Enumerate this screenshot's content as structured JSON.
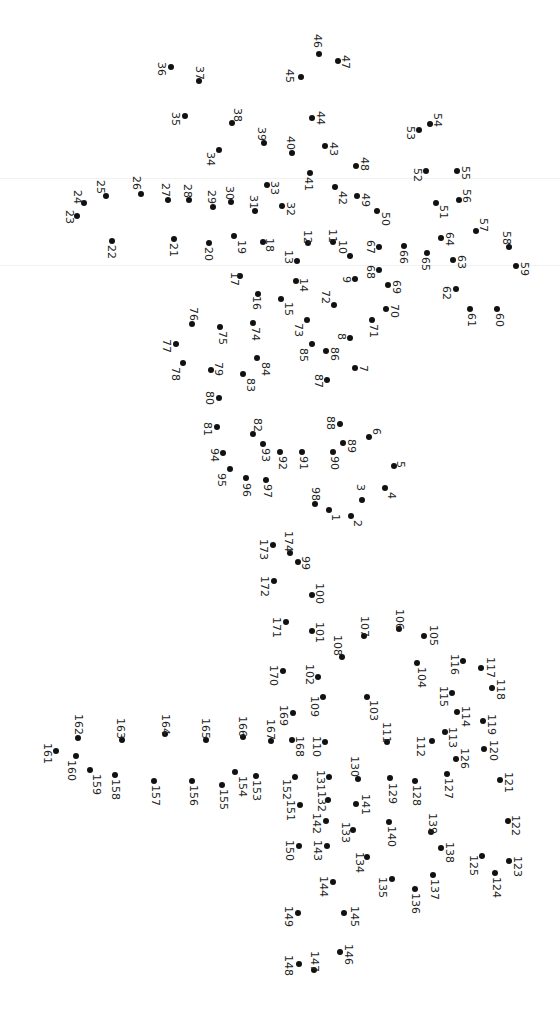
{
  "puzzle": {
    "type": "connect-the-dots",
    "orientation": "rotated 90 degrees clockwise",
    "dot_color": "#111111",
    "background": "#ffffff",
    "dots": [
      {
        "n": 1,
        "x": 329,
        "y": 510,
        "lx": 332,
        "ly": 514
      },
      {
        "n": 2,
        "x": 351,
        "y": 516,
        "lx": 354,
        "ly": 520
      },
      {
        "n": 3,
        "x": 362,
        "y": 500,
        "lx": 357,
        "ly": 484
      },
      {
        "n": 4,
        "x": 385,
        "y": 488,
        "lx": 388,
        "ly": 492
      },
      {
        "n": 5,
        "x": 394,
        "y": 466,
        "lx": 397,
        "ly": 461
      },
      {
        "n": 6,
        "x": 369,
        "y": 437,
        "lx": 373,
        "ly": 428
      },
      {
        "n": 7,
        "x": 355,
        "y": 368,
        "lx": 360,
        "ly": 365
      },
      {
        "n": 8,
        "x": 350,
        "y": 338,
        "lx": 338,
        "ly": 333
      },
      {
        "n": 9,
        "x": 355,
        "y": 279,
        "lx": 343,
        "ly": 276
      },
      {
        "n": 10,
        "x": 350,
        "y": 256,
        "lx": 339,
        "ly": 240
      },
      {
        "n": 11,
        "x": 333,
        "y": 242,
        "lx": 329,
        "ly": 229
      },
      {
        "n": 12,
        "x": 308,
        "y": 243,
        "lx": 304,
        "ly": 230
      },
      {
        "n": 13,
        "x": 297,
        "y": 261,
        "lx": 285,
        "ly": 250
      },
      {
        "n": 14,
        "x": 296,
        "y": 281,
        "lx": 300,
        "ly": 278
      },
      {
        "n": 15,
        "x": 281,
        "y": 299,
        "lx": 285,
        "ly": 302
      },
      {
        "n": 16,
        "x": 258,
        "y": 294,
        "lx": 253,
        "ly": 296
      },
      {
        "n": 17,
        "x": 240,
        "y": 276,
        "lx": 231,
        "ly": 272
      },
      {
        "n": 18,
        "x": 263,
        "y": 242,
        "lx": 266,
        "ly": 238
      },
      {
        "n": 19,
        "x": 234,
        "y": 236,
        "lx": 238,
        "ly": 240
      },
      {
        "n": 20,
        "x": 209,
        "y": 243,
        "lx": 205,
        "ly": 247
      },
      {
        "n": 21,
        "x": 174,
        "y": 239,
        "lx": 170,
        "ly": 243
      },
      {
        "n": 22,
        "x": 112,
        "y": 241,
        "lx": 108,
        "ly": 245
      },
      {
        "n": 23,
        "x": 77,
        "y": 216,
        "lx": 66,
        "ly": 210
      },
      {
        "n": 24,
        "x": 84,
        "y": 203,
        "lx": 74,
        "ly": 190
      },
      {
        "n": 25,
        "x": 106,
        "y": 196,
        "lx": 97,
        "ly": 180
      },
      {
        "n": 26,
        "x": 141,
        "y": 194,
        "lx": 133,
        "ly": 176
      },
      {
        "n": 27,
        "x": 168,
        "y": 200,
        "lx": 162,
        "ly": 183
      },
      {
        "n": 28,
        "x": 189,
        "y": 200,
        "lx": 184,
        "ly": 184
      },
      {
        "n": 29,
        "x": 213,
        "y": 207,
        "lx": 208,
        "ly": 190
      },
      {
        "n": 30,
        "x": 231,
        "y": 202,
        "lx": 226,
        "ly": 186
      },
      {
        "n": 31,
        "x": 255,
        "y": 211,
        "lx": 250,
        "ly": 195
      },
      {
        "n": 32,
        "x": 282,
        "y": 206,
        "lx": 287,
        "ly": 202
      },
      {
        "n": 33,
        "x": 267,
        "y": 185,
        "lx": 271,
        "ly": 181
      },
      {
        "n": 34,
        "x": 219,
        "y": 150,
        "lx": 207,
        "ly": 152
      },
      {
        "n": 35,
        "x": 185,
        "y": 116,
        "lx": 172,
        "ly": 112
      },
      {
        "n": 36,
        "x": 171,
        "y": 67,
        "lx": 158,
        "ly": 62
      },
      {
        "n": 37,
        "x": 199,
        "y": 81,
        "lx": 196,
        "ly": 66
      },
      {
        "n": 38,
        "x": 232,
        "y": 123,
        "lx": 234,
        "ly": 108
      },
      {
        "n": 39,
        "x": 264,
        "y": 143,
        "lx": 258,
        "ly": 127
      },
      {
        "n": 40,
        "x": 292,
        "y": 153,
        "lx": 287,
        "ly": 136
      },
      {
        "n": 41,
        "x": 310,
        "y": 173,
        "lx": 305,
        "ly": 177
      },
      {
        "n": 42,
        "x": 335,
        "y": 187,
        "lx": 339,
        "ly": 191
      },
      {
        "n": 43,
        "x": 325,
        "y": 146,
        "lx": 330,
        "ly": 142
      },
      {
        "n": 44,
        "x": 312,
        "y": 118,
        "lx": 317,
        "ly": 111
      },
      {
        "n": 45,
        "x": 301,
        "y": 77,
        "lx": 286,
        "ly": 69
      },
      {
        "n": 46,
        "x": 319,
        "y": 54,
        "lx": 314,
        "ly": 34
      },
      {
        "n": 47,
        "x": 338,
        "y": 61,
        "lx": 342,
        "ly": 55
      },
      {
        "n": 48,
        "x": 356,
        "y": 166,
        "lx": 361,
        "ly": 157
      },
      {
        "n": 49,
        "x": 357,
        "y": 196,
        "lx": 362,
        "ly": 193
      },
      {
        "n": 50,
        "x": 377,
        "y": 211,
        "lx": 382,
        "ly": 212
      },
      {
        "n": 51,
        "x": 436,
        "y": 203,
        "lx": 440,
        "ly": 205
      },
      {
        "n": 52,
        "x": 426,
        "y": 171,
        "lx": 414,
        "ly": 168
      },
      {
        "n": 53,
        "x": 419,
        "y": 130,
        "lx": 407,
        "ly": 126
      },
      {
        "n": 54,
        "x": 430,
        "y": 124,
        "lx": 434,
        "ly": 113
      },
      {
        "n": 55,
        "x": 457,
        "y": 171,
        "lx": 462,
        "ly": 166
      },
      {
        "n": 56,
        "x": 459,
        "y": 200,
        "lx": 463,
        "ly": 189
      },
      {
        "n": 57,
        "x": 476,
        "y": 231,
        "lx": 480,
        "ly": 218
      },
      {
        "n": 58,
        "x": 509,
        "y": 247,
        "lx": 503,
        "ly": 231
      },
      {
        "n": 59,
        "x": 516,
        "y": 266,
        "lx": 521,
        "ly": 262
      },
      {
        "n": 60,
        "x": 497,
        "y": 309,
        "lx": 496,
        "ly": 313
      },
      {
        "n": 61,
        "x": 470,
        "y": 309,
        "lx": 468,
        "ly": 313
      },
      {
        "n": 62,
        "x": 456,
        "y": 289,
        "lx": 443,
        "ly": 286
      },
      {
        "n": 63,
        "x": 453,
        "y": 260,
        "lx": 458,
        "ly": 255
      },
      {
        "n": 64,
        "x": 441,
        "y": 238,
        "lx": 446,
        "ly": 232
      },
      {
        "n": 65,
        "x": 427,
        "y": 253,
        "lx": 422,
        "ly": 257
      },
      {
        "n": 66,
        "x": 404,
        "y": 246,
        "lx": 400,
        "ly": 250
      },
      {
        "n": 67,
        "x": 379,
        "y": 247,
        "lx": 367,
        "ly": 240
      },
      {
        "n": 68,
        "x": 379,
        "y": 270,
        "lx": 367,
        "ly": 265
      },
      {
        "n": 69,
        "x": 388,
        "y": 285,
        "lx": 393,
        "ly": 280
      },
      {
        "n": 70,
        "x": 386,
        "y": 309,
        "lx": 391,
        "ly": 304
      },
      {
        "n": 71,
        "x": 372,
        "y": 320,
        "lx": 370,
        "ly": 324
      },
      {
        "n": 72,
        "x": 334,
        "y": 305,
        "lx": 322,
        "ly": 290
      },
      {
        "n": 73,
        "x": 307,
        "y": 320,
        "lx": 295,
        "ly": 323
      },
      {
        "n": 74,
        "x": 253,
        "y": 323,
        "lx": 252,
        "ly": 327
      },
      {
        "n": 75,
        "x": 220,
        "y": 327,
        "lx": 219,
        "ly": 331
      },
      {
        "n": 76,
        "x": 192,
        "y": 324,
        "lx": 190,
        "ly": 307
      },
      {
        "n": 77,
        "x": 176,
        "y": 344,
        "lx": 163,
        "ly": 339
      },
      {
        "n": 78,
        "x": 183,
        "y": 363,
        "lx": 172,
        "ly": 367
      },
      {
        "n": 79,
        "x": 211,
        "y": 370,
        "lx": 215,
        "ly": 362
      },
      {
        "n": 80,
        "x": 219,
        "y": 398,
        "lx": 206,
        "ly": 391
      },
      {
        "n": 81,
        "x": 217,
        "y": 427,
        "lx": 204,
        "ly": 422
      },
      {
        "n": 82,
        "x": 253,
        "y": 434,
        "lx": 254,
        "ly": 418
      },
      {
        "n": 83,
        "x": 243,
        "y": 374,
        "lx": 247,
        "ly": 378
      },
      {
        "n": 84,
        "x": 257,
        "y": 358,
        "lx": 262,
        "ly": 362
      },
      {
        "n": 85,
        "x": 312,
        "y": 344,
        "lx": 300,
        "ly": 348
      },
      {
        "n": 86,
        "x": 326,
        "y": 351,
        "lx": 331,
        "ly": 347
      },
      {
        "n": 87,
        "x": 327,
        "y": 380,
        "lx": 315,
        "ly": 374
      },
      {
        "n": 88,
        "x": 340,
        "y": 424,
        "lx": 327,
        "ly": 416
      },
      {
        "n": 89,
        "x": 343,
        "y": 443,
        "lx": 348,
        "ly": 439
      },
      {
        "n": 90,
        "x": 333,
        "y": 452,
        "lx": 331,
        "ly": 456
      },
      {
        "n": 91,
        "x": 302,
        "y": 452,
        "lx": 300,
        "ly": 456
      },
      {
        "n": 92,
        "x": 280,
        "y": 452,
        "lx": 279,
        "ly": 456
      },
      {
        "n": 93,
        "x": 263,
        "y": 444,
        "lx": 262,
        "ly": 448
      },
      {
        "n": 94,
        "x": 223,
        "y": 453,
        "lx": 211,
        "ly": 448
      },
      {
        "n": 95,
        "x": 230,
        "y": 469,
        "lx": 218,
        "ly": 473
      },
      {
        "n": 96,
        "x": 246,
        "y": 478,
        "lx": 243,
        "ly": 483
      },
      {
        "n": 97,
        "x": 266,
        "y": 480,
        "lx": 264,
        "ly": 484
      },
      {
        "n": 98,
        "x": 315,
        "y": 504,
        "lx": 312,
        "ly": 487
      },
      {
        "n": 99,
        "x": 298,
        "y": 562,
        "lx": 302,
        "ly": 556
      },
      {
        "n": 100,
        "x": 312,
        "y": 595,
        "lx": 316,
        "ly": 583
      },
      {
        "n": 101,
        "x": 312,
        "y": 631,
        "lx": 316,
        "ly": 622
      },
      {
        "n": 102,
        "x": 318,
        "y": 677,
        "lx": 306,
        "ly": 664
      },
      {
        "n": 103,
        "x": 367,
        "y": 697,
        "lx": 370,
        "ly": 700
      },
      {
        "n": 104,
        "x": 417,
        "y": 663,
        "lx": 418,
        "ly": 667
      },
      {
        "n": 105,
        "x": 424,
        "y": 636,
        "lx": 430,
        "ly": 625
      },
      {
        "n": 106,
        "x": 399,
        "y": 629,
        "lx": 396,
        "ly": 609
      },
      {
        "n": 107,
        "x": 364,
        "y": 636,
        "lx": 361,
        "ly": 616
      },
      {
        "n": 108,
        "x": 342,
        "y": 657,
        "lx": 334,
        "ly": 635
      },
      {
        "n": 109,
        "x": 323,
        "y": 697,
        "lx": 311,
        "ly": 696
      },
      {
        "n": 110,
        "x": 325,
        "y": 742,
        "lx": 313,
        "ly": 736
      },
      {
        "n": 111,
        "x": 387,
        "y": 742,
        "lx": 383,
        "ly": 722
      },
      {
        "n": 112,
        "x": 432,
        "y": 741,
        "lx": 417,
        "ly": 736
      },
      {
        "n": 113,
        "x": 445,
        "y": 732,
        "lx": 449,
        "ly": 727
      },
      {
        "n": 114,
        "x": 457,
        "y": 712,
        "lx": 462,
        "ly": 706
      },
      {
        "n": 115,
        "x": 452,
        "y": 693,
        "lx": 440,
        "ly": 686
      },
      {
        "n": 116,
        "x": 463,
        "y": 661,
        "lx": 451,
        "ly": 654
      },
      {
        "n": 117,
        "x": 481,
        "y": 668,
        "lx": 487,
        "ly": 657
      },
      {
        "n": 118,
        "x": 492,
        "y": 688,
        "lx": 497,
        "ly": 679
      },
      {
        "n": 119,
        "x": 483,
        "y": 721,
        "lx": 488,
        "ly": 714
      },
      {
        "n": 120,
        "x": 484,
        "y": 749,
        "lx": 490,
        "ly": 740
      },
      {
        "n": 121,
        "x": 500,
        "y": 780,
        "lx": 505,
        "ly": 772
      },
      {
        "n": 122,
        "x": 508,
        "y": 821,
        "lx": 512,
        "ly": 815
      },
      {
        "n": 123,
        "x": 509,
        "y": 861,
        "lx": 514,
        "ly": 856
      },
      {
        "n": 124,
        "x": 495,
        "y": 873,
        "lx": 493,
        "ly": 877
      },
      {
        "n": 125,
        "x": 482,
        "y": 856,
        "lx": 470,
        "ly": 855
      },
      {
        "n": 126,
        "x": 456,
        "y": 759,
        "lx": 461,
        "ly": 748
      },
      {
        "n": 127,
        "x": 447,
        "y": 774,
        "lx": 445,
        "ly": 778
      },
      {
        "n": 128,
        "x": 415,
        "y": 781,
        "lx": 413,
        "ly": 785
      },
      {
        "n": 129,
        "x": 390,
        "y": 778,
        "lx": 389,
        "ly": 783
      },
      {
        "n": 130,
        "x": 358,
        "y": 779,
        "lx": 351,
        "ly": 756
      },
      {
        "n": 131,
        "x": 329,
        "y": 777,
        "lx": 317,
        "ly": 770
      },
      {
        "n": 132,
        "x": 328,
        "y": 800,
        "lx": 318,
        "ly": 791
      },
      {
        "n": 133,
        "x": 353,
        "y": 830,
        "lx": 342,
        "ly": 822
      },
      {
        "n": 134,
        "x": 367,
        "y": 857,
        "lx": 356,
        "ly": 852
      },
      {
        "n": 135,
        "x": 392,
        "y": 879,
        "lx": 379,
        "ly": 877
      },
      {
        "n": 136,
        "x": 415,
        "y": 889,
        "lx": 412,
        "ly": 893
      },
      {
        "n": 137,
        "x": 433,
        "y": 875,
        "lx": 431,
        "ly": 879
      },
      {
        "n": 138,
        "x": 441,
        "y": 848,
        "lx": 446,
        "ly": 842
      },
      {
        "n": 139,
        "x": 431,
        "y": 832,
        "lx": 429,
        "ly": 813
      },
      {
        "n": 140,
        "x": 389,
        "y": 822,
        "lx": 388,
        "ly": 826
      },
      {
        "n": 141,
        "x": 356,
        "y": 804,
        "lx": 362,
        "ly": 794
      },
      {
        "n": 142,
        "x": 326,
        "y": 821,
        "lx": 313,
        "ly": 813
      },
      {
        "n": 143,
        "x": 327,
        "y": 846,
        "lx": 314,
        "ly": 840
      },
      {
        "n": 144,
        "x": 333,
        "y": 882,
        "lx": 320,
        "ly": 876
      },
      {
        "n": 145,
        "x": 344,
        "y": 913,
        "lx": 351,
        "ly": 906
      },
      {
        "n": 146,
        "x": 340,
        "y": 952,
        "lx": 345,
        "ly": 944
      },
      {
        "n": 147,
        "x": 314,
        "y": 970,
        "lx": 311,
        "ly": 951
      },
      {
        "n": 148,
        "x": 299,
        "y": 964,
        "lx": 285,
        "ly": 955
      },
      {
        "n": 149,
        "x": 298,
        "y": 913,
        "lx": 285,
        "ly": 906
      },
      {
        "n": 150,
        "x": 299,
        "y": 846,
        "lx": 286,
        "ly": 840
      },
      {
        "n": 151,
        "x": 300,
        "y": 805,
        "lx": 287,
        "ly": 800
      },
      {
        "n": 152,
        "x": 295,
        "y": 777,
        "lx": 283,
        "ly": 779
      },
      {
        "n": 153,
        "x": 256,
        "y": 776,
        "lx": 253,
        "ly": 780
      },
      {
        "n": 154,
        "x": 235,
        "y": 772,
        "lx": 239,
        "ly": 776
      },
      {
        "n": 155,
        "x": 222,
        "y": 785,
        "lx": 220,
        "ly": 789
      },
      {
        "n": 156,
        "x": 192,
        "y": 781,
        "lx": 190,
        "ly": 785
      },
      {
        "n": 157,
        "x": 154,
        "y": 781,
        "lx": 152,
        "ly": 785
      },
      {
        "n": 158,
        "x": 115,
        "y": 775,
        "lx": 112,
        "ly": 779
      },
      {
        "n": 159,
        "x": 90,
        "y": 770,
        "lx": 93,
        "ly": 774
      },
      {
        "n": 160,
        "x": 76,
        "y": 756,
        "lx": 68,
        "ly": 760
      },
      {
        "n": 161,
        "x": 56,
        "y": 751,
        "lx": 44,
        "ly": 743
      },
      {
        "n": 162,
        "x": 78,
        "y": 738,
        "lx": 75,
        "ly": 714
      },
      {
        "n": 163,
        "x": 122,
        "y": 740,
        "lx": 117,
        "ly": 718
      },
      {
        "n": 164,
        "x": 165,
        "y": 734,
        "lx": 162,
        "ly": 714
      },
      {
        "n": 165,
        "x": 206,
        "y": 740,
        "lx": 202,
        "ly": 718
      },
      {
        "n": 166,
        "x": 243,
        "y": 737,
        "lx": 239,
        "ly": 716
      },
      {
        "n": 167,
        "x": 271,
        "y": 741,
        "lx": 267,
        "ly": 719
      },
      {
        "n": 168,
        "x": 292,
        "y": 740,
        "lx": 296,
        "ly": 736
      },
      {
        "n": 169,
        "x": 293,
        "y": 713,
        "lx": 280,
        "ly": 705
      },
      {
        "n": 170,
        "x": 283,
        "y": 671,
        "lx": 270,
        "ly": 665
      },
      {
        "n": 171,
        "x": 286,
        "y": 622,
        "lx": 273,
        "ly": 617
      },
      {
        "n": 172,
        "x": 274,
        "y": 581,
        "lx": 261,
        "ly": 576
      },
      {
        "n": 173,
        "x": 273,
        "y": 545,
        "lx": 260,
        "ly": 539
      },
      {
        "n": 174,
        "x": 290,
        "y": 553,
        "lx": 285,
        "ly": 531
      }
    ]
  }
}
